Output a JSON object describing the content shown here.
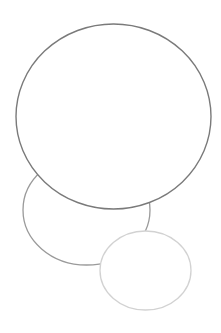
{
  "canvas": {
    "width": 221,
    "height": 333,
    "background": "#ffffff"
  },
  "shapes": [
    {
      "name": "middle-left-ellipse",
      "type": "ellipse",
      "cx": 86.5,
      "cy": 210,
      "rx": 63.5,
      "ry": 55,
      "stroke": "#9a9a9a",
      "fill": "#ffffff",
      "stroke_width": 1.3
    },
    {
      "name": "large-top-circle",
      "type": "ellipse",
      "cx": 113.5,
      "cy": 116.5,
      "rx": 97.5,
      "ry": 92.5,
      "stroke": "#7a7a7a",
      "fill": "#ffffff",
      "stroke_width": 1.4
    },
    {
      "name": "small-bottom-right-ellipse",
      "type": "ellipse",
      "cx": 145.5,
      "cy": 270.5,
      "rx": 45.5,
      "ry": 39.5,
      "stroke": "#d2d2d2",
      "fill": "#ffffff",
      "stroke_width": 1.3
    }
  ]
}
